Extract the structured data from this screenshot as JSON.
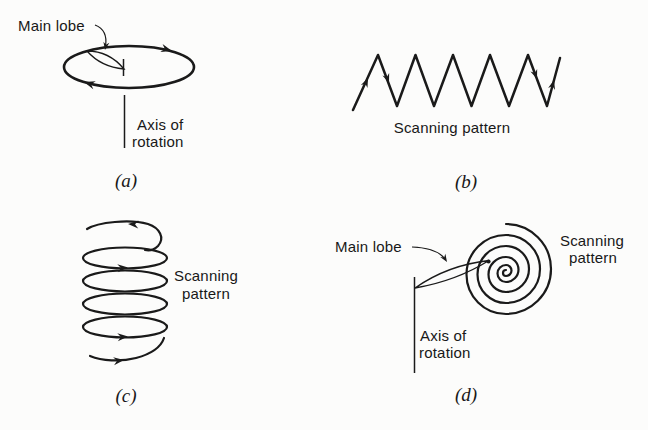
{
  "colors": {
    "ink": "#1a1a1a",
    "background": "#fcfcfb"
  },
  "panels": {
    "a": {
      "caption": "(a)",
      "main_lobe_label": "Main lobe",
      "axis_label_line1": "Axis of",
      "axis_label_line2": "rotation"
    },
    "b": {
      "caption": "(b)",
      "scanning_label": "Scanning pattern"
    },
    "c": {
      "caption": "(c)",
      "scanning_label_line1": "Scanning",
      "scanning_label_line2": "pattern"
    },
    "d": {
      "caption": "(d)",
      "main_lobe_label": "Main lobe",
      "axis_label_line1": "Axis of",
      "axis_label_line2": "rotation",
      "scanning_label_line1": "Scanning",
      "scanning_label_line2": "pattern"
    }
  }
}
